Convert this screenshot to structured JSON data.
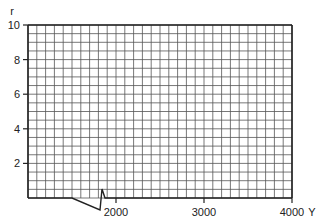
{
  "chart_data": {
    "type": "line",
    "title": "",
    "xlabel": "Y",
    "ylabel": "r",
    "xlim": [
      1000,
      4000
    ],
    "ylim": [
      0,
      10
    ],
    "x_ticks": [
      2000,
      3000,
      4000
    ],
    "x_tick_labels": [
      "2000",
      "3000",
      "4000"
    ],
    "y_ticks": [
      2,
      4,
      6,
      8,
      10
    ],
    "y_tick_labels": [
      "2",
      "4",
      "6",
      "8",
      "10"
    ],
    "grid": true,
    "grid_minor_x_step": 100,
    "grid_minor_y_step": 0.5,
    "x_axis_break": true,
    "series": []
  },
  "axes": {
    "x_label": "Y",
    "y_label": "r"
  }
}
